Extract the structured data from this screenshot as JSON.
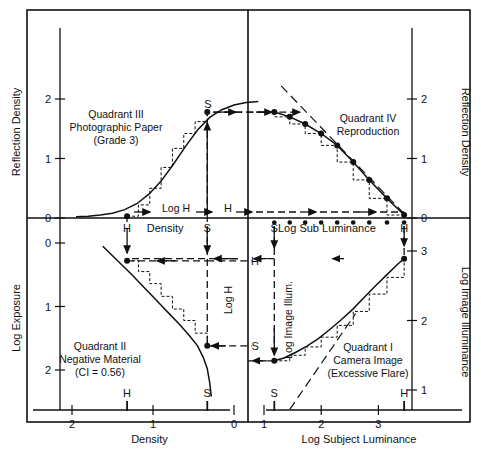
{
  "figure": {
    "frame": {
      "x": 27,
      "y": 10,
      "w": 443,
      "h": 412
    },
    "origin": {
      "x": 248,
      "y": 218
    },
    "stroke_color": "#111111",
    "background": "#ffffff"
  },
  "axes": {
    "top_left_y": {
      "label": "Reflection Density",
      "ticks": [
        "2",
        "1",
        "0"
      ]
    },
    "top_right_y": {
      "label": "Reflection Density",
      "ticks": [
        "2",
        "1",
        "0"
      ]
    },
    "bottom_left_y": {
      "label": "Log Exposure",
      "ticks": [
        "0",
        "1",
        "2"
      ]
    },
    "bottom_right_y": {
      "label": "Log Image Illuminance",
      "ticks": [
        "3",
        "2",
        "1"
      ]
    },
    "bottom_left_x": {
      "label": "Density",
      "ticks": [
        "2",
        "1",
        "0"
      ],
      "reversed": true
    },
    "bottom_right_x": {
      "label": "Log Subject Luminance",
      "ticks": [
        "1",
        "2",
        "3"
      ]
    },
    "center_left_x": {
      "label": "Density"
    },
    "center_right_x": {
      "label": "Log Sub Luminance"
    }
  },
  "quadrants": {
    "q3": {
      "name": "Quadrant III",
      "line2": "Photographic Paper",
      "line3": "(Grade 3)"
    },
    "q4": {
      "name": "Quadrant IV",
      "line2": "Reproduction"
    },
    "q2": {
      "name": "Quadrant II",
      "line2": "Negative Material",
      "line3": "(CI = 0.56)"
    },
    "q1": {
      "name": "Quadrant I",
      "line2": "Camera Image",
      "line3": "(Excessive Flare)"
    }
  },
  "markers": {
    "highlight": "H",
    "shadow": "S",
    "log_h": "Log H",
    "log_image_illum": "Log Image Illum."
  },
  "chart_data": {
    "type": "line",
    "subcharts": [
      {
        "id": "q3",
        "title": "Quadrant III Photographic Paper (Grade 3)",
        "xlabel": "Density",
        "ylabel": "Reflection Density",
        "xlim": [
          2.4,
          -0.35
        ],
        "ylim": [
          0,
          2.45
        ],
        "curve_x": [
          1.95,
          1.8,
          1.65,
          1.5,
          1.35,
          1.2,
          1.05,
          0.9,
          0.75,
          0.6,
          0.45,
          0.3,
          0.15,
          0.0,
          -0.15,
          -0.3
        ],
        "curve_y": [
          0.02,
          0.03,
          0.05,
          0.08,
          0.14,
          0.24,
          0.4,
          0.62,
          0.9,
          1.2,
          1.48,
          1.69,
          1.82,
          1.9,
          1.94,
          1.96
        ],
        "points_x": [
          1.32,
          0.33
        ],
        "points_y": [
          0.03,
          1.78
        ],
        "step_x": [
          1.32,
          1.18,
          1.04,
          0.9,
          0.76,
          0.62,
          0.48,
          0.33
        ],
        "step_y": [
          0.03,
          0.22,
          0.5,
          0.85,
          1.17,
          1.42,
          1.62,
          1.78
        ]
      },
      {
        "id": "q2",
        "title": "Quadrant II Negative Material (CI = 0.56)",
        "xlabel": "Density",
        "ylabel": "Log Exposure",
        "xlim": [
          2.4,
          -0.35
        ],
        "ylim": [
          -0.2,
          2.6
        ],
        "curve_x": [
          1.62,
          1.5,
          1.38,
          1.26,
          1.14,
          1.02,
          0.9,
          0.78,
          0.66,
          0.55,
          0.45,
          0.38,
          0.33,
          0.3,
          0.28
        ],
        "curve_y": [
          0.05,
          0.2,
          0.35,
          0.5,
          0.66,
          0.82,
          0.98,
          1.14,
          1.3,
          1.46,
          1.62,
          1.8,
          1.98,
          2.2,
          2.42
        ],
        "points_x": [
          1.32,
          0.33
        ],
        "points_y": [
          0.28,
          1.62
        ],
        "step_x": [
          1.32,
          1.18,
          1.04,
          0.9,
          0.76,
          0.62,
          0.48,
          0.33
        ],
        "step_y": [
          0.28,
          0.45,
          0.64,
          0.84,
          1.04,
          1.22,
          1.42,
          1.62
        ]
      },
      {
        "id": "q1",
        "title": "Quadrant I Camera Image (Excessive Flare)",
        "xlabel": "Log Subject Luminance",
        "ylabel": "Log Image Illuminance",
        "xlim": [
          0.55,
          3.75
        ],
        "ylim": [
          0.45,
          3.35
        ],
        "curve_x": [
          1.18,
          1.35,
          1.55,
          1.75,
          1.95,
          2.15,
          2.35,
          2.55,
          2.75,
          2.95,
          3.15,
          3.35,
          3.45
        ],
        "curve_y": [
          1.42,
          1.46,
          1.54,
          1.63,
          1.74,
          1.87,
          2.01,
          2.16,
          2.33,
          2.5,
          2.66,
          2.82,
          2.89
        ],
        "flare_free_line_x": [
          1.45,
          2.6
        ],
        "flare_free_line_y": [
          0.72,
          2.1
        ],
        "points_x": [
          1.18,
          3.45
        ],
        "points_y": [
          1.42,
          2.89
        ],
        "step_x": [
          1.18,
          1.45,
          1.72,
          2.0,
          2.28,
          2.56,
          2.84,
          3.15,
          3.45
        ],
        "step_y": [
          1.42,
          1.5,
          1.62,
          1.76,
          1.93,
          2.13,
          2.38,
          2.62,
          2.89
        ]
      },
      {
        "id": "q4",
        "title": "Quadrant IV Reproduction",
        "xlabel": "Log Subject Luminance",
        "ylabel": "Reflection Density",
        "xlim": [
          0.55,
          3.75
        ],
        "ylim": [
          0,
          2.45
        ],
        "curve_x": [
          1.18,
          1.45,
          1.72,
          2.0,
          2.28,
          2.56,
          2.84,
          3.15,
          3.45
        ],
        "curve_y": [
          1.78,
          1.7,
          1.58,
          1.42,
          1.22,
          0.94,
          0.64,
          0.33,
          0.05
        ],
        "ideal_line_x": [
          1.3,
          3.5
        ],
        "ideal_line_y": [
          2.22,
          0.02
        ],
        "points_x": [
          1.18,
          1.45,
          1.72,
          2.0,
          2.28,
          2.56,
          2.84,
          3.15,
          3.45
        ],
        "points_y": [
          1.78,
          1.7,
          1.58,
          1.42,
          1.22,
          0.94,
          0.64,
          0.33,
          0.05
        ]
      }
    ],
    "axis_dots_log_sub_luminance": [
      1.18,
      1.45,
      1.72,
      2.0,
      2.28,
      2.56,
      2.84,
      3.15,
      3.45
    ],
    "reference_marks": {
      "H_density": 1.32,
      "S_density": 0.33,
      "S_log_sub_luminance": 1.18,
      "H_log_sub_luminance": 3.45
    }
  }
}
